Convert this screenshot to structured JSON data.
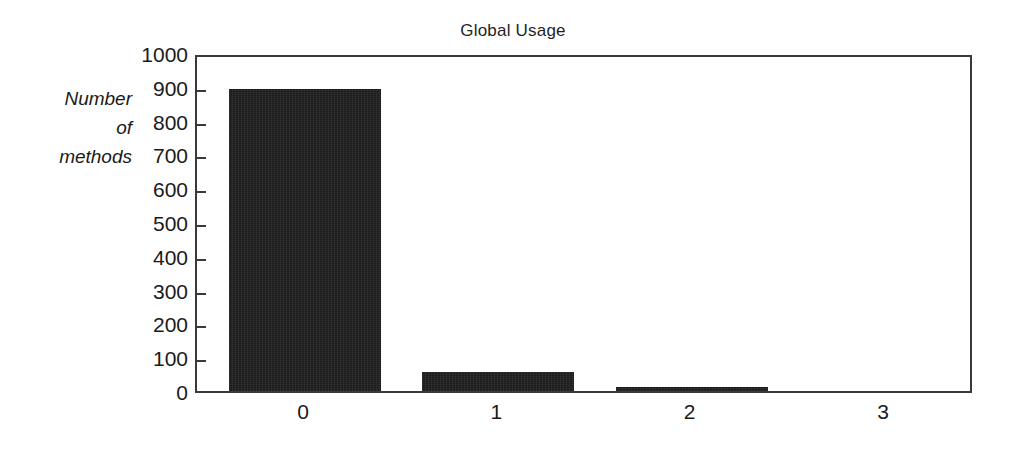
{
  "chart_data": {
    "type": "bar",
    "title": "Global Usage",
    "xlabel": "",
    "ylabel": "Number of methods",
    "ylabel_lines": [
      "Number",
      "of",
      "methods"
    ],
    "categories": [
      "0",
      "1",
      "2",
      "3"
    ],
    "values": [
      895,
      55,
      13,
      0
    ],
    "series": [
      {
        "name": "Number of methods",
        "values": [
          895,
          55,
          13,
          0
        ]
      }
    ],
    "ylim": [
      0,
      1000
    ],
    "ytick_values": [
      0,
      100,
      200,
      300,
      400,
      500,
      600,
      700,
      800,
      900,
      1000
    ],
    "ytick_labels": [
      "0",
      "100",
      "200",
      "300",
      "400",
      "500",
      "600",
      "700",
      "800",
      "900",
      "1000"
    ],
    "grid": false,
    "legend": false,
    "legend_position": "none",
    "bar_color": "#1c1c1c",
    "axis_color": "#3a3a3a",
    "background_color": "#ffffff",
    "annotations": []
  }
}
